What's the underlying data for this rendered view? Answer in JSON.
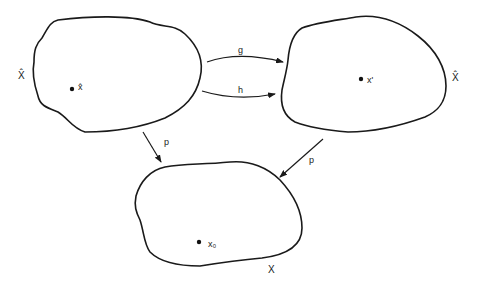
{
  "diagram": {
    "sets": {
      "left": {
        "label": "X̂",
        "point_label": "x̂"
      },
      "right": {
        "label": "X̂",
        "point_label": "x'"
      },
      "bottom": {
        "label": "X",
        "point_label": "x₀"
      }
    },
    "arrows": {
      "g": {
        "label": "g",
        "from": "left",
        "to": "right"
      },
      "h": {
        "label": "h",
        "from": "left",
        "to": "right"
      },
      "p_left": {
        "label": "p",
        "from": "left",
        "to": "bottom"
      },
      "p_right": {
        "label": "p",
        "from": "right",
        "to": "bottom"
      }
    },
    "colors": {
      "stroke": "#1a1a1a",
      "background": "#ffffff"
    }
  }
}
